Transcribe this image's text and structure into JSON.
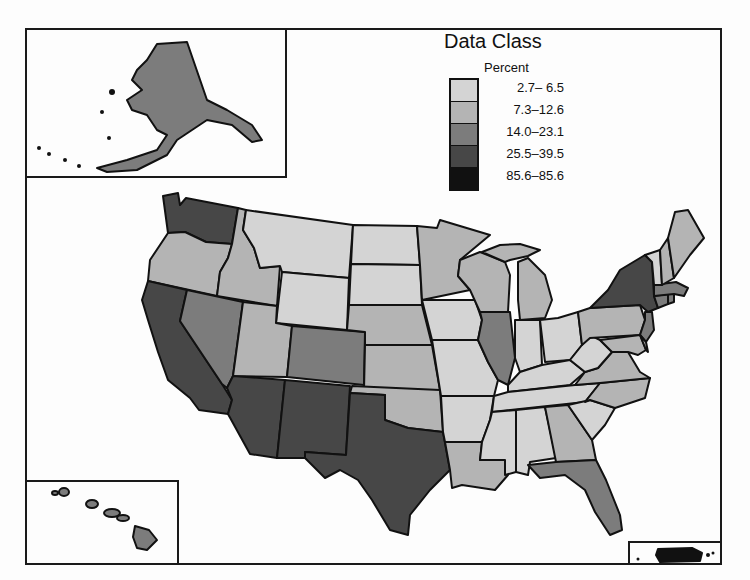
{
  "legend": {
    "title": "Data Class",
    "subtitle": "Percent",
    "classes": [
      {
        "label": "  2.7– 6.5",
        "color": "#d4d4d4"
      },
      {
        "label": "7.3–12.6",
        "color": "#b4b4b4"
      },
      {
        "label": "14.0–23.1",
        "color": "#7c7c7c"
      },
      {
        "label": "25.5–39.5",
        "color": "#474747"
      },
      {
        "label": "85.6–85.6",
        "color": "#111111"
      }
    ]
  },
  "map": {
    "regions": {
      "washington": 3,
      "oregon": 1,
      "california": 3,
      "idaho": 1,
      "nevada": 2,
      "montana": 0,
      "wyoming": 0,
      "utah": 1,
      "colorado": 2,
      "arizona": 3,
      "new_mexico": 3,
      "north_dakota": 0,
      "south_dakota": 0,
      "nebraska": 1,
      "kansas": 1,
      "oklahoma": 1,
      "texas": 3,
      "minnesota": 1,
      "iowa": 0,
      "missouri": 0,
      "arkansas": 0,
      "louisiana": 1,
      "wisconsin": 1,
      "illinois": 2,
      "michigan": 1,
      "indiana": 0,
      "ohio": 0,
      "kentucky": 0,
      "tennessee": 0,
      "mississippi": 0,
      "alabama": 0,
      "georgia": 1,
      "florida": 2,
      "south_carolina": 0,
      "north_carolina": 1,
      "virginia": 1,
      "west_virginia": 0,
      "pennsylvania": 1,
      "new_york": 3,
      "new_jersey": 2,
      "maryland": 1,
      "delaware": 1,
      "connecticut": 2,
      "rhode_island": 2,
      "massachusetts": 2,
      "vermont": 0,
      "new_hampshire": 1,
      "maine": 1,
      "alaska": 2,
      "hawaii": 2,
      "puerto_rico": 4
    }
  }
}
